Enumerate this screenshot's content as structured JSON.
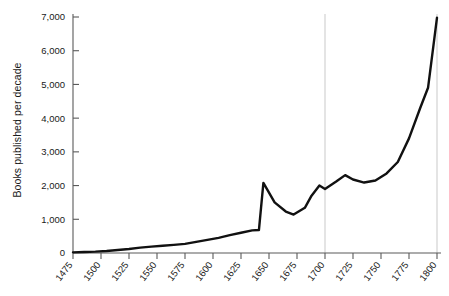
{
  "chart_data": {
    "type": "line",
    "title": "",
    "xlabel": "",
    "ylabel": "Books published per decade",
    "xlim": [
      1475,
      1800
    ],
    "ylim": [
      0,
      7000
    ],
    "xticks": [
      1475,
      1500,
      1525,
      1550,
      1575,
      1600,
      1625,
      1650,
      1675,
      1700,
      1725,
      1750,
      1775,
      1800
    ],
    "xtick_labels": [
      "1475",
      "1500",
      "1525",
      "1550",
      "1575",
      "1600",
      "1625",
      "1650",
      "1675",
      "1700",
      "1725",
      "1750",
      "1775",
      "1800"
    ],
    "yticks": [
      0,
      1000,
      2000,
      3000,
      4000,
      5000,
      6000,
      7000
    ],
    "ytick_labels": [
      "0",
      "1,000",
      "2,000",
      "3,000",
      "4,000",
      "5,000",
      "6,000",
      "7,000"
    ],
    "grid": "vertical-only-at-1700-and-1800",
    "gridlines_x": [
      1700,
      1800
    ],
    "legend": "none",
    "line_color": "#111111",
    "grid_color": "#c9c9c9",
    "axis_color": "#5a5a5a",
    "series": [
      {
        "name": "Books published per decade",
        "x": [
          1475,
          1485,
          1495,
          1505,
          1515,
          1525,
          1535,
          1545,
          1555,
          1565,
          1575,
          1585,
          1595,
          1605,
          1615,
          1625,
          1635,
          1641,
          1645,
          1655,
          1665,
          1672,
          1682,
          1688,
          1695,
          1700,
          1710,
          1718,
          1725,
          1735,
          1745,
          1755,
          1765,
          1775,
          1785,
          1792,
          1800
        ],
        "values": [
          20,
          30,
          40,
          60,
          90,
          120,
          160,
          190,
          215,
          240,
          270,
          330,
          390,
          450,
          530,
          600,
          670,
          680,
          2080,
          1500,
          1230,
          1140,
          1340,
          1700,
          2000,
          1900,
          2120,
          2310,
          2180,
          2090,
          2150,
          2360,
          2700,
          3400,
          4300,
          4900,
          6980
        ]
      }
    ]
  },
  "axis": {
    "ylabel": "Books published per decade"
  }
}
